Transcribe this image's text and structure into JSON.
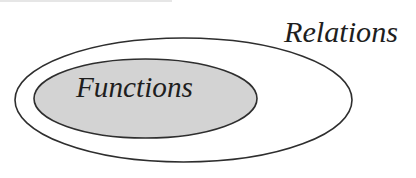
{
  "diagram": {
    "type": "euler-subset",
    "outer_set": {
      "label": "Relations",
      "fill": "#ffffff",
      "stroke": "#2e2e2e",
      "shape": {
        "cx": 183.5,
        "cy": 100,
        "rx": 168.5,
        "ry": 62
      }
    },
    "inner_set": {
      "label": "Functions",
      "fill": "#d3d3d3",
      "stroke": "#2e2e2e",
      "shape": {
        "cx": 145.5,
        "cy": 98.5,
        "rx": 111.5,
        "ry": 39.5
      }
    },
    "relationship": "Functions ⊂ Relations"
  }
}
